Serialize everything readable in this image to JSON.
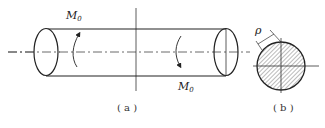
{
  "figure_a": {
    "caption": "( a )",
    "moment_left": {
      "symbol": "M",
      "subscript": "0"
    },
    "moment_right": {
      "symbol": "M",
      "subscript": "0"
    },
    "description": "Cylindrical shaft under equal and opposite torques M0"
  },
  "figure_b": {
    "caption": "( b )",
    "radius_label": "ρ",
    "description": "Hatched circular cross-section with radial distance ρ"
  },
  "colors": {
    "stroke": "#222222",
    "background": "#ffffff"
  }
}
